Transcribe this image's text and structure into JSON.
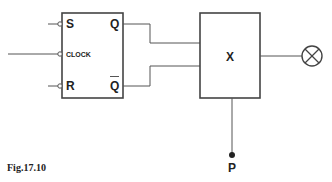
{
  "diagram": {
    "flip_flop": {
      "inputs": {
        "s": "S",
        "clock": "CLOCK",
        "r": "R"
      },
      "outputs": {
        "q": "Q",
        "q_bar": "Q"
      }
    },
    "block": {
      "label": "X"
    },
    "terminal": {
      "label": "P"
    },
    "output_device": "lamp-icon"
  },
  "caption": "Fig.17.10",
  "colors": {
    "stroke": "#555555",
    "box_stroke": "#444444",
    "text": "#222222",
    "background": "#ffffff"
  }
}
